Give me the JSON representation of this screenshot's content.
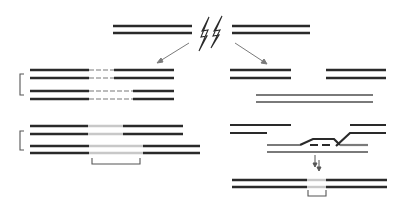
{
  "diagram": {
    "description": "DNA double-strand break repair pathways",
    "colors": {
      "strand": "#2a2a2a",
      "strand_grey": "#7a7a7a",
      "gap_light": "#c8c8c8",
      "arrow": "#7a7a7a",
      "bracket": "#555555"
    },
    "top": {
      "left_segment": {
        "x1": 113,
        "x2": 192,
        "y_top": 26,
        "y_bottom": 33
      },
      "right_segment": {
        "x1": 232,
        "x2": 310,
        "y_top": 26,
        "y_bottom": 33
      },
      "break_icon": "lightning-bolt-icon"
    },
    "arrows": [
      {
        "name": "arrow-left-pathway",
        "x1": 189,
        "y1": 43,
        "x2": 158,
        "y2": 62
      },
      {
        "name": "arrow-right-pathway",
        "x1": 235,
        "y1": 43,
        "x2": 266,
        "y2": 64
      }
    ],
    "left_pathway": {
      "stage1": {
        "pairs": [
          {
            "y_top": 70,
            "y_bottom": 78,
            "x1": 30,
            "x2": 174,
            "gap_x1": 89,
            "gap_x2": 114
          },
          {
            "y_top": 91,
            "y_bottom": 99,
            "x1": 30,
            "x2": 174,
            "gap_x1": 89,
            "gap_x2": 133
          }
        ],
        "bracket": {
          "x": 20,
          "y1": 74,
          "y2": 95
        }
      },
      "stage2": {
        "pairs": [
          {
            "y_top": 126,
            "y_bottom": 134,
            "x1": 30,
            "x2": 183,
            "light_x1": 88,
            "light_x2": 123
          },
          {
            "y_top": 146,
            "y_bottom": 153,
            "x1": 30,
            "x2": 200,
            "light_x1": 89,
            "light_x2": 143
          }
        ],
        "bracket_side": {
          "x": 20,
          "y1": 131,
          "y2": 150
        },
        "bracket_bottom": {
          "x1": 92,
          "x2": 140,
          "y1": 158,
          "y2": 164
        }
      }
    },
    "right_pathway": {
      "stage1": {
        "broken_left": {
          "x1": 230,
          "x2": 291,
          "y_top": 70,
          "y_bottom": 78
        },
        "broken_right": {
          "x1": 326,
          "x2": 386,
          "y_top": 70,
          "y_bottom": 78
        },
        "template": {
          "x1": 256,
          "x2": 373,
          "y_top": 95,
          "y_bottom": 102
        }
      },
      "stage2": {
        "broken_left": {
          "x1": 230,
          "x2": 291,
          "x1b": 230,
          "x2b": 267,
          "y_top": 125,
          "y_bottom": 133
        },
        "broken_right": {
          "x1": 350,
          "x2": 386,
          "y_top": 125,
          "y_bottom": 133
        },
        "template": {
          "x1": 267,
          "x2": 368,
          "y_top": 145,
          "y_bottom": 152
        }
      },
      "stage3": {
        "pair": {
          "x1": 232,
          "x2": 387,
          "y_top": 180,
          "y_bottom": 187,
          "light_x1": 307,
          "light_x2": 326
        },
        "bracket_bottom": {
          "x1": 308,
          "x2": 326,
          "y1": 190,
          "y2": 196
        }
      }
    }
  }
}
